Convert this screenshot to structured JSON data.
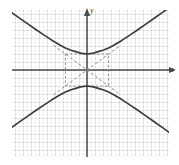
{
  "figure": {
    "background_color": "#ffffff",
    "grid_color": "#c9c9c9",
    "major_grid_color": "#a8a8a8",
    "axis_color": "#4a4a4a",
    "curve_color": "#3c3c3c",
    "dashed_color": "#8a8a8a"
  },
  "axes": {
    "y_label": "y",
    "x_label": "x",
    "y_arrow": "arrow-up-icon",
    "x_arrow": "arrow-right-icon",
    "origin_px": [
      87,
      70
    ],
    "grid_spacing_px": 8,
    "major_every": 1
  },
  "chart_data": {
    "type": "line",
    "xlabel": "x",
    "ylabel": "y",
    "xlim": [
      -9.4,
      11.5
    ],
    "ylim": [
      -11.9,
      7.5
    ],
    "grid": true,
    "legend": "none",
    "center": [
      0,
      0
    ],
    "orientation": "vertical",
    "semi_axis_a": 2,
    "semi_axis_b": 2.7,
    "vertices": [
      [
        0,
        2
      ],
      [
        0,
        -2
      ]
    ],
    "asymptote_slopes": [
      0.74,
      -0.74
    ],
    "fundamental_rectangle": {
      "x_range": [
        -2.7,
        2.7
      ],
      "y_range": [
        -2,
        2
      ],
      "style": "dashed"
    },
    "series": [
      {
        "name": "upper-branch",
        "style": "solid",
        "x": [
          -9.4,
          -8.4,
          -7.4,
          -6.4,
          -5.4,
          -4.4,
          -3.4,
          -2.7,
          -2.0,
          -1.4,
          -0.8,
          0,
          0.8,
          1.4,
          2.0,
          2.7,
          3.4,
          4.4,
          5.4,
          6.4,
          7.4,
          8.4,
          9.4,
          10.4,
          11.5
        ],
        "y": [
          7.17,
          6.46,
          5.76,
          5.07,
          4.39,
          3.73,
          3.12,
          2.76,
          2.47,
          2.29,
          2.11,
          2.0,
          2.11,
          2.29,
          2.47,
          2.76,
          3.12,
          3.73,
          4.39,
          5.07,
          5.76,
          6.46,
          7.17,
          7.88,
          8.65
        ]
      },
      {
        "name": "lower-branch",
        "style": "solid",
        "x": [
          -9.4,
          -8.4,
          -7.4,
          -6.4,
          -5.4,
          -4.4,
          -3.4,
          -2.7,
          -2.0,
          -1.4,
          -0.8,
          0,
          0.8,
          1.4,
          2.0,
          2.7,
          3.4,
          4.4,
          5.4,
          6.4,
          7.4,
          8.4,
          9.4,
          10.4,
          11.5
        ],
        "y": [
          -7.17,
          -6.46,
          -5.76,
          -5.07,
          -4.39,
          -3.73,
          -3.12,
          -2.76,
          -2.47,
          -2.29,
          -2.11,
          -2.0,
          -2.11,
          -2.29,
          -2.47,
          -2.76,
          -3.12,
          -3.73,
          -4.39,
          -5.07,
          -5.76,
          -6.46,
          -7.17,
          -7.88,
          -8.65
        ]
      },
      {
        "name": "asymptote-positive-slope",
        "style": "dashed",
        "x": [
          -4.2,
          4.2
        ],
        "y": [
          -3.11,
          3.11
        ]
      },
      {
        "name": "asymptote-negative-slope",
        "style": "dashed",
        "x": [
          -4.2,
          4.2
        ],
        "y": [
          3.11,
          -3.11
        ]
      }
    ]
  }
}
